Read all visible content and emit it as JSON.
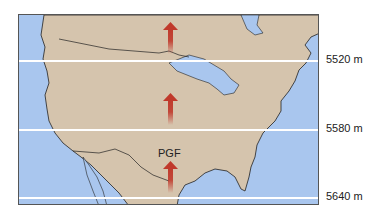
{
  "map": {
    "region": "North America (contiguous US)",
    "colors": {
      "land": "#d5c4ad",
      "water": "#a9c6ee",
      "contour": "#ffffff",
      "arrow": "#c0392b"
    }
  },
  "contours": [
    {
      "label": "5520 m",
      "y": 60
    },
    {
      "label": "5580 m",
      "y": 129
    },
    {
      "label": "5640 m",
      "y": 197
    }
  ],
  "arrows": [
    {
      "label": ""
    },
    {
      "label": ""
    },
    {
      "label": "PGF"
    }
  ],
  "pgf_label": "PGF"
}
